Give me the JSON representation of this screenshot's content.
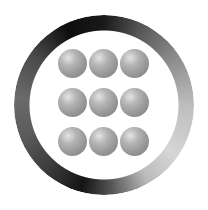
{
  "icon": {
    "name": "app-grid-launcher",
    "shape": "ring-with-3x3-spheres",
    "rows": 3,
    "columns": 3,
    "dots": [
      {
        "row": 0,
        "col": 0
      },
      {
        "row": 0,
        "col": 1
      },
      {
        "row": 0,
        "col": 2
      },
      {
        "row": 1,
        "col": 0
      },
      {
        "row": 1,
        "col": 1
      },
      {
        "row": 1,
        "col": 2
      },
      {
        "row": 2,
        "col": 0
      },
      {
        "row": 2,
        "col": 1
      },
      {
        "row": 2,
        "col": 2
      }
    ],
    "colors": {
      "ring_dark": "#151515",
      "ring_light": "#d6d6d6",
      "sphere_base": "#999999",
      "sphere_highlight": "#e4e4e4",
      "background": "#ffffff"
    }
  }
}
